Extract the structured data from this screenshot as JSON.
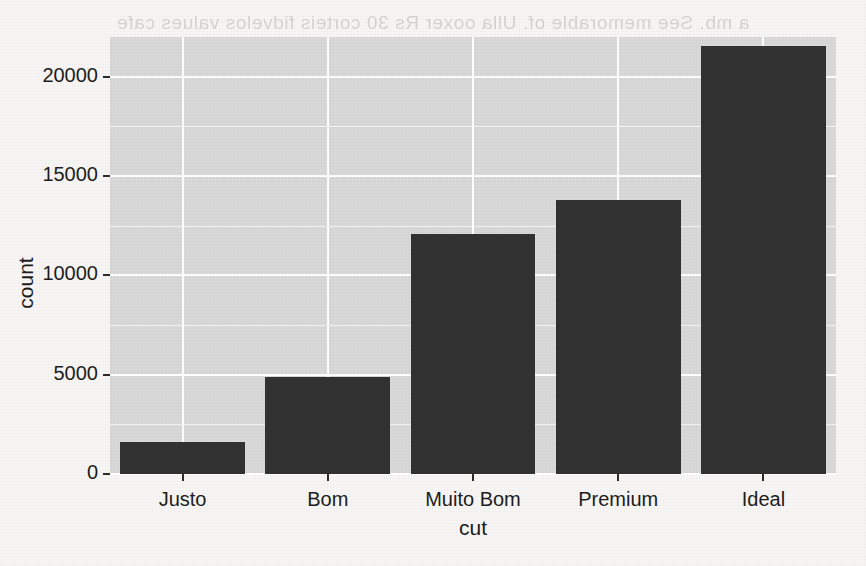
{
  "chart_data": {
    "type": "bar",
    "title": "",
    "subtitle": "",
    "xlabel": "cut",
    "ylabel": "count",
    "categories": [
      "Justo",
      "Bom",
      "Muito Bom",
      "Premium",
      "Ideal"
    ],
    "values": [
      1610,
      4906,
      12082,
      13791,
      21551
    ],
    "series": [
      {
        "name": "count",
        "values": [
          1610,
          4906,
          12082,
          13791,
          21551
        ]
      }
    ],
    "ylim": [
      0,
      22000
    ],
    "y_ticks": [
      0,
      5000,
      10000,
      15000,
      20000
    ],
    "y_tick_labels": [
      "0",
      "5000",
      "10000",
      "15000",
      "20000"
    ],
    "y_minor_ticks": [
      2500,
      7500,
      12500,
      17500
    ],
    "x_tick_labels": [
      "Justo",
      "Bom",
      "Muito Bom",
      "Premium",
      "Ideal"
    ],
    "grid": true,
    "legend": false,
    "legend_position": "none",
    "bar_color": "#333232",
    "panel_color": "#d9d9d9",
    "grid_color": "#ffffff",
    "annotations": []
  },
  "background_bleed": {
    "line1": "a mb. See memorable of. Ulla ooxer Rs 30 corteis fidvelos values  cafe",
    "line2": "f de um cuss 67 9850 67"
  }
}
